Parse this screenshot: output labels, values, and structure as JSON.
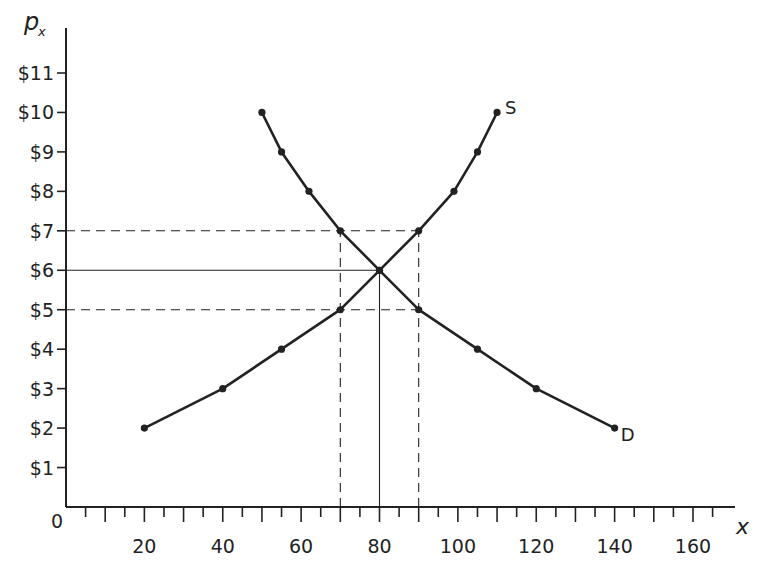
{
  "chart_data": {
    "type": "line",
    "title": "",
    "xlabel": "x",
    "ylabel": "p_x",
    "ylabel_main": "p",
    "ylabel_sub": "x",
    "origin_label": "0",
    "xlim": [
      0,
      170
    ],
    "ylim": [
      0,
      11.8
    ],
    "x_ticks": [
      20,
      40,
      60,
      80,
      100,
      120,
      140,
      160
    ],
    "x_tick_labels": [
      "20",
      "40",
      "60",
      "80",
      "100",
      "120",
      "140",
      "160"
    ],
    "x_minor_step": 5,
    "y_ticks": [
      1,
      2,
      3,
      4,
      5,
      6,
      7,
      8,
      9,
      10,
      11
    ],
    "y_tick_labels": [
      "$1",
      "$2",
      "$3",
      "$4",
      "$5",
      "$6",
      "$7",
      "$8",
      "$9",
      "$10",
      "$11"
    ],
    "grid": false,
    "legend": "none (curves labeled directly)",
    "series": [
      {
        "name": "S",
        "label": "S",
        "x": [
          20,
          40,
          55,
          70,
          80,
          90,
          99,
          105,
          110
        ],
        "y": [
          2,
          3,
          4,
          5,
          6,
          7,
          8,
          9,
          10
        ]
      },
      {
        "name": "D",
        "label": "D",
        "x": [
          50,
          55,
          62,
          70,
          80,
          90,
          105,
          120,
          140
        ],
        "y": [
          10,
          9,
          8,
          7,
          6,
          5,
          4,
          3,
          2
        ]
      }
    ],
    "equilibrium": {
      "x": 80,
      "y": 6
    },
    "reference_lines": [
      {
        "type": "horizontal",
        "y": 7,
        "x_to": 90,
        "style": "dashed"
      },
      {
        "type": "horizontal",
        "y": 5,
        "x_to": 90,
        "style": "dashed"
      },
      {
        "type": "horizontal",
        "y": 6,
        "x_to": 80,
        "style": "solid"
      },
      {
        "type": "vertical",
        "x": 70,
        "y_to": 7,
        "style": "dashed"
      },
      {
        "type": "vertical",
        "x": 90,
        "y_to": 7,
        "style": "dashed"
      },
      {
        "type": "vertical",
        "x": 80,
        "y_to": 6,
        "style": "solid"
      }
    ]
  },
  "colors": {
    "background": "#ffffff",
    "ink": "#222222",
    "curve": "#222222"
  }
}
